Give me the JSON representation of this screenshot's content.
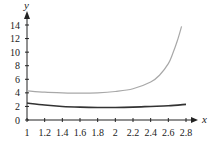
{
  "chart_data": {
    "type": "line",
    "title": "",
    "xlabel": "x",
    "ylabel": "y",
    "xlim": [
      1,
      2.8
    ],
    "ylim": [
      0,
      14
    ],
    "grid": false,
    "legend": null,
    "x_ticks": [
      "1",
      "1.2",
      "1.4",
      "1.6",
      "1.8",
      "2",
      "2.2",
      "2.4",
      "2.6",
      "2.8"
    ],
    "y_ticks": [
      "0",
      "2",
      "4",
      "6",
      "8",
      "10",
      "12",
      "14"
    ],
    "series": [
      {
        "name": "upper curve (light gray)",
        "color": "#a8a8a8",
        "x": [
          1,
          1.2,
          1.4,
          1.6,
          1.8,
          2,
          2.2,
          2.4,
          2.5,
          2.6,
          2.65,
          2.7,
          2.75
        ],
        "values": [
          4.3,
          4.1,
          4.0,
          3.95,
          4.0,
          4.2,
          4.6,
          5.6,
          6.6,
          8.3,
          9.8,
          11.6,
          13.8
        ]
      },
      {
        "name": "lower curve (dark)",
        "color": "#333333",
        "x": [
          1,
          1.2,
          1.4,
          1.6,
          1.8,
          2,
          2.2,
          2.4,
          2.6,
          2.8
        ],
        "values": [
          2.5,
          2.2,
          2.0,
          1.9,
          1.85,
          1.85,
          1.9,
          2.0,
          2.1,
          2.3
        ]
      }
    ]
  }
}
